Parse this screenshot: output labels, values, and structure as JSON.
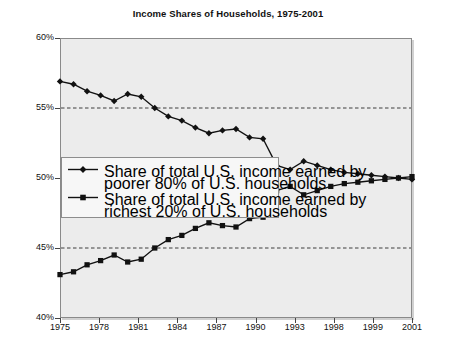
{
  "chart_data": {
    "type": "line",
    "title": "Income Shares of Households, 1975-2001",
    "xlabel": "",
    "ylabel": "",
    "ylim": [
      40,
      60
    ],
    "ytick_values": [
      40,
      45,
      50,
      55,
      60
    ],
    "ytick_labels": [
      "40%",
      "45%",
      "50%",
      "55%",
      "60%"
    ],
    "gridlines_dashed_at": [
      45,
      55
    ],
    "grid": true,
    "legend_position": "center-left",
    "x": [
      1975,
      1976,
      1977,
      1978,
      1979,
      1980,
      1981,
      1982,
      1983,
      1984,
      1985,
      1986,
      1987,
      1988,
      1989,
      1990,
      1991,
      1992,
      1993,
      1994,
      1995,
      1996,
      1997,
      1998,
      1999,
      2000,
      2001
    ],
    "xtick_labels": [
      "1975",
      "1978",
      "1981",
      "1984",
      "1987",
      "1990",
      "1993",
      "1998",
      "1999",
      "2001"
    ],
    "xtick_positions": [
      1975,
      1978,
      1981,
      1984,
      1987,
      1990,
      1993,
      1996,
      1998,
      2001
    ],
    "series": [
      {
        "name": "Share of total U.S. income earned by poorer 80% of U.S. households",
        "marker": "diamond",
        "color": "#111111",
        "values": [
          56.9,
          56.7,
          56.2,
          55.9,
          55.5,
          56.0,
          55.8,
          55.0,
          54.4,
          54.1,
          53.6,
          53.2,
          53.4,
          53.5,
          52.9,
          52.8,
          50.9,
          50.6,
          51.2,
          50.9,
          50.6,
          50.4,
          50.3,
          50.2,
          50.1,
          50.0,
          49.9
        ]
      },
      {
        "name": "Share of total U.S. income earned by richest 20% of U.S. households",
        "marker": "square",
        "color": "#111111",
        "values": [
          43.1,
          43.3,
          43.8,
          44.1,
          44.5,
          44.0,
          44.2,
          45.0,
          45.6,
          45.9,
          46.4,
          46.8,
          46.6,
          46.5,
          47.1,
          47.2,
          49.1,
          49.4,
          48.8,
          49.1,
          49.4,
          49.6,
          49.7,
          49.8,
          49.9,
          50.0,
          50.1
        ]
      }
    ]
  },
  "legend": {
    "entries": [
      {
        "line1": "Share of total U.S. income earned by",
        "line2": "poorer 80% of U.S. households",
        "marker": "diamond"
      },
      {
        "line1": "Share of total U.S. income earned by",
        "line2": "richest 20% of U.S. households",
        "marker": "square"
      }
    ]
  }
}
